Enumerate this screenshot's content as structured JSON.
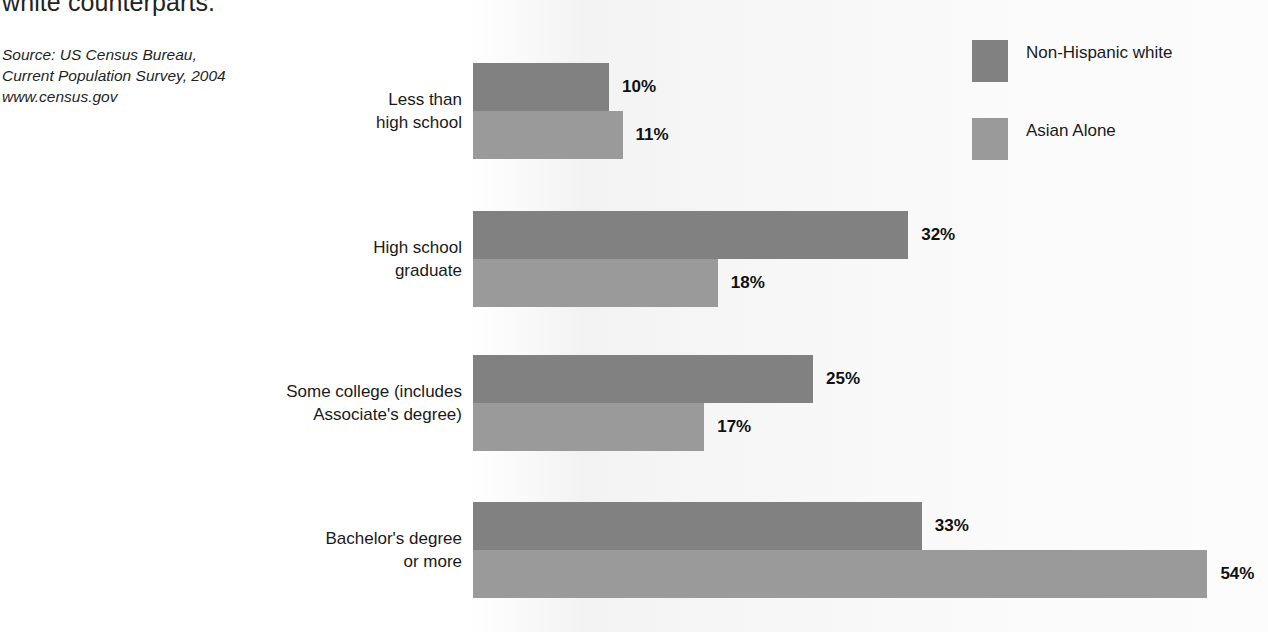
{
  "headline": "white counterparts.",
  "source": {
    "line1": "Source: US Census Bureau,",
    "line2": "Current Population Survey, 2004",
    "line3": "www.census.gov"
  },
  "legend": {
    "items": [
      {
        "label": "Non-Hispanic white",
        "color": "#818181"
      },
      {
        "label": "Asian Alone",
        "color": "#9a9a9a"
      }
    ]
  },
  "chart_data": {
    "type": "bar",
    "orientation": "horizontal",
    "title": "",
    "xlabel": "",
    "ylabel": "",
    "grid": false,
    "legend_position": "top-right",
    "value_suffix": "%",
    "xlim": [
      0,
      60
    ],
    "categories": [
      "Less than high school",
      "High school graduate",
      "Some college (includes Associate's degree)",
      "Bachelor's degree or more"
    ],
    "category_lines": [
      [
        "Less than",
        "high school"
      ],
      [
        "High school",
        "graduate"
      ],
      [
        "Some college (includes",
        "Associate's degree)"
      ],
      [
        "Bachelor's degree",
        "or more"
      ]
    ],
    "series": [
      {
        "name": "Non-Hispanic white",
        "color": "#818181",
        "values": [
          10,
          32,
          25,
          33
        ],
        "labels": [
          "10%",
          "32%",
          "25%",
          "33%"
        ]
      },
      {
        "name": "Asian Alone",
        "color": "#9a9a9a",
        "values": [
          11,
          18,
          17,
          54
        ],
        "labels": [
          "11%",
          "18%",
          "17%",
          "54%"
        ]
      }
    ]
  }
}
